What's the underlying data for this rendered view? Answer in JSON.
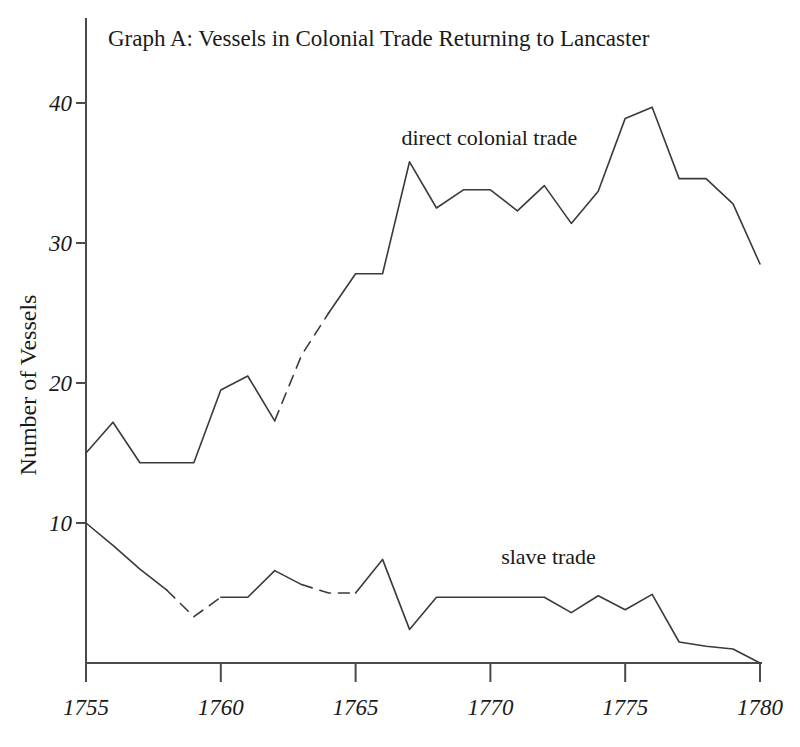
{
  "chart_data": {
    "type": "line",
    "title": "Graph A: Vessels in Colonial Trade Returning to Lancaster",
    "xlabel": "",
    "ylabel": "Number of Vessels",
    "xlim": [
      1755,
      1780
    ],
    "ylim": [
      0,
      43
    ],
    "xticks": [
      1755,
      1760,
      1765,
      1770,
      1775,
      1780
    ],
    "xtick_labels": [
      "1755",
      "1760",
      "1765",
      "1770",
      "1775",
      "1780"
    ],
    "yticks": [
      10,
      20,
      30,
      40
    ],
    "ytick_labels": [
      "10",
      "20",
      "30",
      "40"
    ],
    "grid": false,
    "legend_position": "inline-annotation",
    "x": [
      1755,
      1756,
      1757,
      1758,
      1759,
      1760,
      1761,
      1762,
      1763,
      1764,
      1765,
      1766,
      1767,
      1768,
      1769,
      1770,
      1771,
      1772,
      1773,
      1774,
      1775,
      1776,
      1777,
      1778,
      1779,
      1780
    ],
    "series": [
      {
        "name": "direct colonial trade",
        "label": "direct colonial trade",
        "label_x": 1766.7,
        "label_y": 37.0,
        "color": "#3a3a3a",
        "values": [
          15.0,
          17.2,
          14.3,
          14.3,
          14.3,
          19.5,
          20.5,
          17.3,
          22.0,
          25.0,
          27.8,
          27.8,
          35.8,
          32.5,
          33.8,
          33.8,
          32.3,
          34.1,
          31.4,
          33.7,
          38.9,
          39.7,
          34.6,
          34.6,
          32.8,
          28.5
        ],
        "dashed_segments": [
          [
            1762,
            1764
          ]
        ]
      },
      {
        "name": "slave trade",
        "label": "slave trade",
        "label_x": 1770.4,
        "label_y": 7.1,
        "color": "#3a3a3a",
        "values": [
          10.0,
          8.4,
          6.7,
          5.2,
          3.3,
          4.7,
          4.7,
          6.6,
          5.6,
          5.0,
          5.0,
          7.4,
          2.4,
          4.7,
          4.7,
          4.7,
          4.7,
          4.7,
          3.6,
          4.8,
          3.8,
          4.9,
          1.5,
          1.2,
          1.0,
          0.0
        ],
        "dashed_segments": [
          [
            1758,
            1760
          ],
          [
            1763,
            1765
          ]
        ]
      }
    ]
  }
}
